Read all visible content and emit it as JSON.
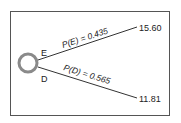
{
  "tree": {
    "node": {
      "type": "chance",
      "color": "#8a8a8a"
    },
    "branches": [
      {
        "label": "E",
        "probability_text": "P(E) = 0.435",
        "payoff": "15.60"
      },
      {
        "label": "D",
        "probability_text": "P(D) = 0.565",
        "payoff": "11.81"
      }
    ],
    "line_color": "#333333"
  }
}
